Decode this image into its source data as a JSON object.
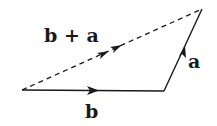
{
  "diagram": {
    "title": "",
    "vectors": [
      {
        "name": "b",
        "label": "b",
        "style": "solid",
        "from": [
          22,
          90
        ],
        "to": [
          164,
          91
        ]
      },
      {
        "name": "a",
        "label": "a",
        "style": "solid",
        "from": [
          164,
          91
        ],
        "to": [
          202,
          9
        ]
      },
      {
        "name": "b+a",
        "label": "b + a",
        "style": "dashed",
        "from": [
          22,
          90
        ],
        "to": [
          202,
          9
        ]
      }
    ],
    "labels": {
      "sum": "b + a",
      "a": "a",
      "b": "b"
    },
    "colors": {
      "stroke": "#1a1a1a",
      "background": "#ffffff"
    }
  }
}
